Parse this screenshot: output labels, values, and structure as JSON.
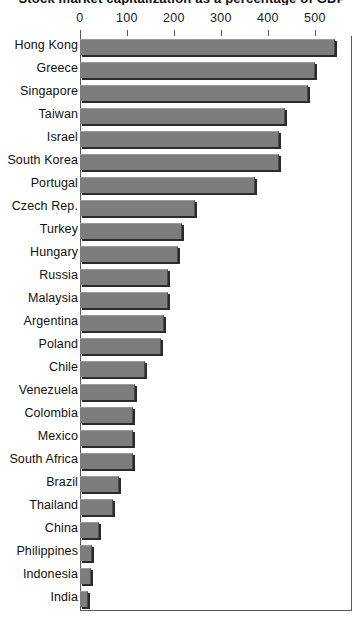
{
  "chart_data": {
    "type": "bar",
    "orientation": "horizontal",
    "title": "Stock market capitalization as a percentage of GDP",
    "xlabel": "",
    "ylabel": "",
    "xlim": [
      0,
      543
    ],
    "axis_max_label": 500,
    "grid": false,
    "legend": null,
    "x_ticks": [
      0,
      100,
      200,
      300,
      400,
      500
    ],
    "x_tick_labels": [
      "0",
      "100",
      "200",
      "300",
      "400",
      "500"
    ],
    "categories": [
      "Hong Kong",
      "Greece",
      "Singapore",
      "Taiwan",
      "Israel",
      "South Korea",
      "Portugal",
      "Czech Rep.",
      "Turkey",
      "Hungary",
      "Russia",
      "Malaysia",
      "Argentina",
      "Poland",
      "Chile",
      "Venezuela",
      "Colombia",
      "Mexico",
      "South Africa",
      "Brazil",
      "Thailand",
      "China",
      "Philippines",
      "Indonesia",
      "India"
    ],
    "values": [
      543,
      500,
      485,
      436,
      423,
      423,
      372,
      245,
      217,
      209,
      187,
      187,
      179,
      172,
      138,
      117,
      113,
      113,
      113,
      83,
      70,
      40,
      26,
      23,
      17
    ],
    "bar_color": "#7d7d7d",
    "axis_color": "#5a5a5a"
  }
}
